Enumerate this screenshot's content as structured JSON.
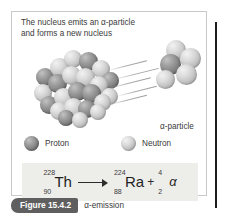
{
  "figure": {
    "caption_text": "The nucleus emits an α-particle\nand forms a new nucleus",
    "caption_line1": "The nucleus emits an α-particle",
    "caption_line2": "and forms a new nucleus",
    "alpha_particle_label": "α-particle",
    "figure_number": "Figure 15.4.2",
    "figure_title": "α-emission"
  },
  "legend": {
    "items": [
      {
        "label": "Proton",
        "kind": "dark"
      },
      {
        "label": "Neutron",
        "kind": "light"
      }
    ]
  },
  "equation": {
    "parent": {
      "mass_number": "228",
      "atomic_number": "90",
      "symbol": "Th"
    },
    "daughter": {
      "mass_number": "224",
      "atomic_number": "88",
      "symbol": "Ra"
    },
    "emitted": {
      "mass_number": "4",
      "atomic_number": "2",
      "symbol": "α"
    },
    "plus_sign": "+",
    "arrow": "→"
  },
  "colors": {
    "proton": "#7f7f7f",
    "neutron": "#c8c8c8",
    "panel_border": "#c9c9c9",
    "equation_background": "#ededea",
    "figure_tab_background": "#5f5f5f",
    "text": "#3a3a3a",
    "side_rule": "#1c1c1c"
  },
  "nucleus_spheres": [
    {
      "x": 12,
      "y": 30,
      "d": 18,
      "kind": "dark"
    },
    {
      "x": 26,
      "y": 20,
      "d": 19,
      "kind": "light"
    },
    {
      "x": 40,
      "y": 12,
      "d": 18,
      "kind": "light"
    },
    {
      "x": 55,
      "y": 14,
      "d": 19,
      "kind": "dark"
    },
    {
      "x": 68,
      "y": 22,
      "d": 18,
      "kind": "light"
    },
    {
      "x": 78,
      "y": 34,
      "d": 17,
      "kind": "dark"
    },
    {
      "x": 10,
      "y": 46,
      "d": 18,
      "kind": "light"
    },
    {
      "x": 24,
      "y": 36,
      "d": 19,
      "kind": "dark"
    },
    {
      "x": 38,
      "y": 28,
      "d": 19,
      "kind": "light"
    },
    {
      "x": 52,
      "y": 30,
      "d": 19,
      "kind": "light"
    },
    {
      "x": 66,
      "y": 38,
      "d": 18,
      "kind": "light"
    },
    {
      "x": 77,
      "y": 50,
      "d": 17,
      "kind": "light"
    },
    {
      "x": 16,
      "y": 58,
      "d": 18,
      "kind": "dark"
    },
    {
      "x": 30,
      "y": 50,
      "d": 19,
      "kind": "light"
    },
    {
      "x": 44,
      "y": 44,
      "d": 19,
      "kind": "dark"
    },
    {
      "x": 58,
      "y": 46,
      "d": 19,
      "kind": "dark"
    },
    {
      "x": 70,
      "y": 56,
      "d": 17,
      "kind": "light"
    },
    {
      "x": 26,
      "y": 64,
      "d": 18,
      "kind": "light"
    },
    {
      "x": 40,
      "y": 60,
      "d": 19,
      "kind": "light"
    },
    {
      "x": 54,
      "y": 62,
      "d": 18,
      "kind": "dark"
    },
    {
      "x": 66,
      "y": 66,
      "d": 16,
      "kind": "light"
    },
    {
      "x": 34,
      "y": 72,
      "d": 16,
      "kind": "dark"
    },
    {
      "x": 48,
      "y": 74,
      "d": 16,
      "kind": "light"
    }
  ],
  "alpha_spheres": [
    {
      "x": 14,
      "y": 0,
      "d": 20,
      "kind": "light"
    },
    {
      "x": 28,
      "y": 8,
      "d": 21,
      "kind": "light"
    },
    {
      "x": 8,
      "y": 14,
      "d": 21,
      "kind": "dark"
    },
    {
      "x": 24,
      "y": 24,
      "d": 21,
      "kind": "light"
    },
    {
      "x": 4,
      "y": 30,
      "d": 19,
      "kind": "light"
    }
  ],
  "motion_lines": [
    {
      "x": 0,
      "y": 4,
      "w": 40
    },
    {
      "x": 6,
      "y": 13,
      "w": 46
    },
    {
      "x": 0,
      "y": 22,
      "w": 44
    },
    {
      "x": 8,
      "y": 30,
      "w": 42
    },
    {
      "x": 2,
      "y": 38,
      "w": 38
    }
  ]
}
